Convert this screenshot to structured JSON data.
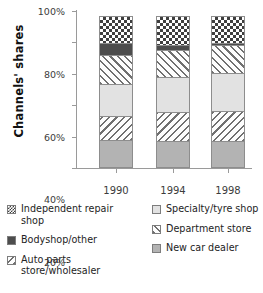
{
  "chart_data": {
    "type": "bar",
    "subtype": "stacked-column-100",
    "title": "",
    "xlabel": "",
    "ylabel": "Channels' shares",
    "categories": [
      "1990",
      "1994",
      "1998"
    ],
    "ylim": [
      0,
      100
    ],
    "ytick_labels": [
      "0%",
      "20%",
      "40%",
      "60%",
      "80%",
      "100%"
    ],
    "ytick_values": [
      0,
      20,
      40,
      60,
      80,
      100
    ],
    "grid": false,
    "legend_position": "bottom",
    "units": "percent",
    "series": [
      {
        "name": "New car dealer",
        "pattern": "medgray",
        "values": [
          18,
          17,
          17
        ]
      },
      {
        "name": "Auto parts store/wholesaler",
        "pattern": "hatch-down",
        "values": [
          16,
          19,
          20
        ]
      },
      {
        "name": "Specialty/tyre shop",
        "pattern": "lightgray",
        "values": [
          21,
          23,
          25
        ]
      },
      {
        "name": "Department store",
        "pattern": "hatch-up",
        "values": [
          19,
          18,
          18
        ]
      },
      {
        "name": "Bodyshop/other",
        "pattern": "darkgray",
        "values": [
          8,
          4,
          2
        ]
      },
      {
        "name": "Independent repair shop",
        "pattern": "checker",
        "values": [
          18,
          19,
          18
        ]
      }
    ]
  },
  "axis": {
    "y_title": "Channels' shares",
    "y_ticks": [
      {
        "label": "100%",
        "value": 100
      },
      {
        "label": "80%",
        "value": 80
      },
      {
        "label": "60%",
        "value": 60
      },
      {
        "label": "40%",
        "value": 40
      },
      {
        "label": "20%",
        "value": 20
      },
      {
        "label": "0%",
        "value": 0
      }
    ],
    "x_ticks": [
      {
        "label": "1990"
      },
      {
        "label": "1994"
      },
      {
        "label": "1998"
      }
    ]
  },
  "legend": {
    "left_column": [
      {
        "label": "Independent repair shop",
        "pattern": "checker"
      },
      {
        "label": "Bodyshop/other",
        "pattern": "darkgray"
      },
      {
        "label": "Auto parts store/wholesaler",
        "pattern": "hatch-down"
      }
    ],
    "right_column": [
      {
        "label": "Specialty/tyre shop",
        "pattern": "lightgray"
      },
      {
        "label": "Department store",
        "pattern": "hatch-up"
      },
      {
        "label": "New car dealer",
        "pattern": "medgray"
      }
    ]
  },
  "colors": {
    "axis": "#9a9a9a",
    "segment_border": "#8d8d8d",
    "dark_gray": "#4d4d4d",
    "medium_gray": "#b3b3b3",
    "light_gray": "#e2e2e2",
    "hatch_line": "#707070",
    "background": "#ffffff",
    "text": "#232323"
  }
}
